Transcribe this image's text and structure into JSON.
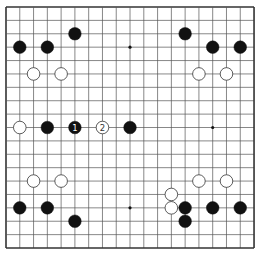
{
  "board": {
    "size": 19,
    "origin_x": 6,
    "origin_y": 7,
    "spacing_x": 13.78,
    "spacing_y": 13.39,
    "line_color": "#555555",
    "border_color": "#333333",
    "background": "#ffffff",
    "star_points": [
      [
        3,
        3
      ],
      [
        9,
        3
      ],
      [
        15,
        3
      ],
      [
        3,
        9
      ],
      [
        9,
        9
      ],
      [
        15,
        9
      ],
      [
        3,
        15
      ],
      [
        9,
        15
      ],
      [
        15,
        15
      ]
    ],
    "stone_radius": 6.3
  },
  "colors": {
    "black_stone": "#111111",
    "white_stone": "#ffffff",
    "white_stroke": "#333333",
    "label_on_black": "#ffffff",
    "label_on_white": "#333333"
  },
  "stones": [
    {
      "color": "black",
      "col": 1,
      "row": 3
    },
    {
      "color": "black",
      "col": 3,
      "row": 3
    },
    {
      "color": "black",
      "col": 5,
      "row": 2
    },
    {
      "color": "white",
      "col": 2,
      "row": 5
    },
    {
      "color": "white",
      "col": 4,
      "row": 5
    },
    {
      "color": "black",
      "col": 13,
      "row": 2
    },
    {
      "color": "black",
      "col": 15,
      "row": 3
    },
    {
      "color": "black",
      "col": 17,
      "row": 3
    },
    {
      "color": "white",
      "col": 14,
      "row": 5
    },
    {
      "color": "white",
      "col": 16,
      "row": 5
    },
    {
      "color": "white",
      "col": 1,
      "row": 9
    },
    {
      "color": "black",
      "col": 3,
      "row": 9
    },
    {
      "color": "black",
      "col": 5,
      "row": 9,
      "label": "1"
    },
    {
      "color": "white",
      "col": 7,
      "row": 9,
      "label": "2"
    },
    {
      "color": "black",
      "col": 9,
      "row": 9
    },
    {
      "color": "white",
      "col": 2,
      "row": 13
    },
    {
      "color": "white",
      "col": 4,
      "row": 13
    },
    {
      "color": "black",
      "col": 1,
      "row": 15
    },
    {
      "color": "black",
      "col": 3,
      "row": 15
    },
    {
      "color": "black",
      "col": 5,
      "row": 16
    },
    {
      "color": "white",
      "col": 14,
      "row": 13
    },
    {
      "color": "white",
      "col": 16,
      "row": 13
    },
    {
      "color": "white",
      "col": 12,
      "row": 14
    },
    {
      "color": "white",
      "col": 12,
      "row": 15
    },
    {
      "color": "black",
      "col": 13,
      "row": 15
    },
    {
      "color": "black",
      "col": 15,
      "row": 15
    },
    {
      "color": "black",
      "col": 17,
      "row": 15
    },
    {
      "color": "black",
      "col": 13,
      "row": 16
    }
  ]
}
